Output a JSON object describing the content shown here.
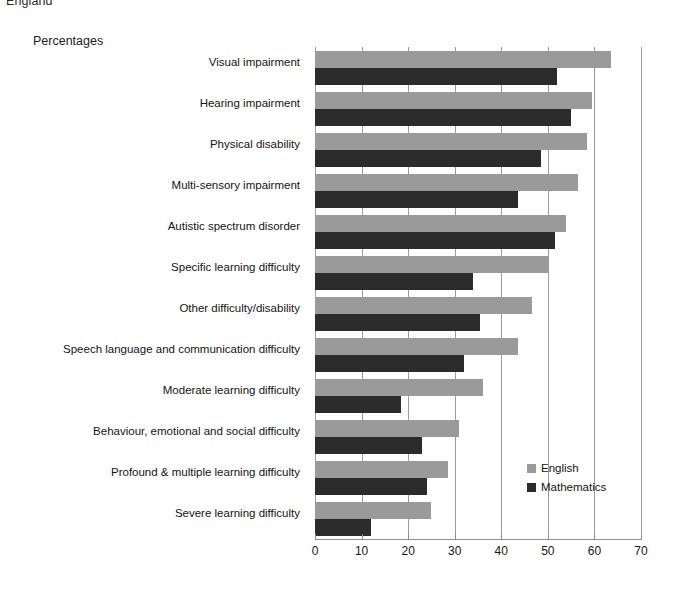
{
  "header": {
    "region_title": "England",
    "axis_note": "Percentages"
  },
  "legend": {
    "position": "inside-bottom-right",
    "entries": [
      {
        "label": "English",
        "color": "#9a9a9a"
      },
      {
        "label": "Mathematics",
        "color": "#2b2b2b"
      }
    ]
  },
  "axis": {
    "x_ticks": [
      "0",
      "10",
      "20",
      "30",
      "40",
      "50",
      "60",
      "70"
    ]
  },
  "colors": {
    "english": "#9a9a9a",
    "mathematics": "#2b2b2b",
    "gridline": "#9b9b9b",
    "axis": "#8d8d8d",
    "text": "#141414",
    "background": "#ffffff"
  },
  "chart_data": {
    "type": "bar",
    "orientation": "horizontal",
    "title": "England",
    "subtitle": "Percentages",
    "xlabel": "",
    "ylabel": "",
    "xlim": [
      0,
      70
    ],
    "xticks": [
      0,
      10,
      20,
      30,
      40,
      50,
      60,
      70
    ],
    "grid": true,
    "legend_position": "inside-bottom-right",
    "categories": [
      "Visual impairment",
      "Hearing impairment",
      "Physical disability",
      "Multi-sensory impairment",
      "Autistic spectrum disorder",
      "Specific learning difficulty",
      "Other difficulty/disability",
      "Speech language and communication difficulty",
      "Moderate learning difficulty",
      "Behaviour, emotional and social difficulty",
      "Profound & multiple learning difficulty",
      "Severe learning difficulty"
    ],
    "series": [
      {
        "name": "English",
        "color": "#9a9a9a",
        "values": [
          63.5,
          59.5,
          58.5,
          56.5,
          54.0,
          50.0,
          46.5,
          43.5,
          36.0,
          31.0,
          28.5,
          25.0
        ]
      },
      {
        "name": "Mathematics",
        "color": "#2b2b2b",
        "values": [
          52.0,
          55.0,
          48.5,
          43.5,
          51.5,
          34.0,
          35.5,
          32.0,
          18.5,
          23.0,
          24.0,
          12.0
        ]
      }
    ]
  }
}
